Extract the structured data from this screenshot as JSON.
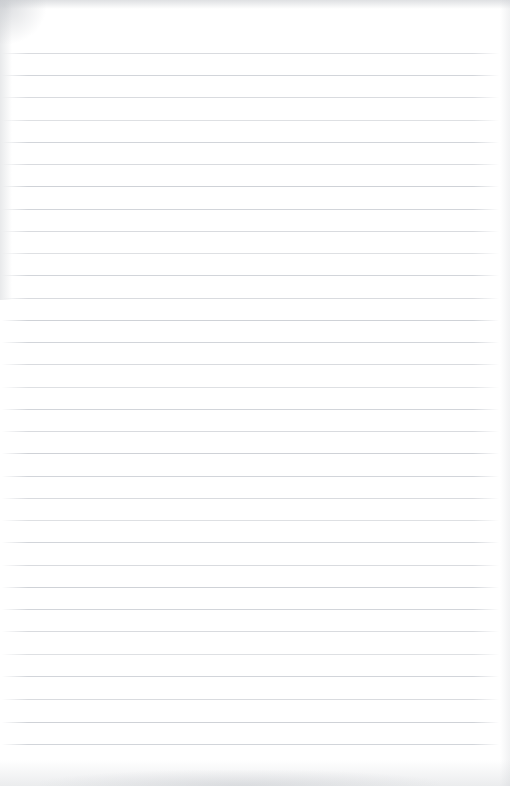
{
  "document": {
    "kind": "scanned-lined-paper",
    "title": "",
    "body_text": "",
    "is_blank": true,
    "page_width": 510,
    "page_height": 786,
    "background_color": "#ffffff"
  },
  "ruling": {
    "line_color": "#d5d8dc",
    "line_thickness": 1,
    "line_spacing": 22.2,
    "first_line_y": 53,
    "last_line_y": 744,
    "line_count": 32,
    "line_left_x": 2,
    "line_right_x": 499,
    "top_margin": 53,
    "bottom_margin": 42,
    "left_margin": 2,
    "right_margin": 11,
    "has_vertical_margin_rule": false,
    "lines": [
      {
        "y": 53,
        "variant": "v1"
      },
      {
        "y": 75,
        "variant": "v2"
      },
      {
        "y": 97,
        "variant": "v1"
      },
      {
        "y": 120,
        "variant": "v3"
      },
      {
        "y": 142,
        "variant": "v2"
      },
      {
        "y": 164,
        "variant": "v1"
      },
      {
        "y": 186,
        "variant": "v4"
      },
      {
        "y": 209,
        "variant": "v2"
      },
      {
        "y": 231,
        "variant": "v1"
      },
      {
        "y": 253,
        "variant": "v3"
      },
      {
        "y": 275,
        "variant": "v2"
      },
      {
        "y": 298,
        "variant": "v1"
      },
      {
        "y": 320,
        "variant": "v4"
      },
      {
        "y": 342,
        "variant": "v2"
      },
      {
        "y": 364,
        "variant": "v1"
      },
      {
        "y": 387,
        "variant": "v3"
      },
      {
        "y": 409,
        "variant": "v2"
      },
      {
        "y": 431,
        "variant": "v1"
      },
      {
        "y": 453,
        "variant": "v4"
      },
      {
        "y": 476,
        "variant": "v2"
      },
      {
        "y": 498,
        "variant": "v1"
      },
      {
        "y": 520,
        "variant": "v3"
      },
      {
        "y": 542,
        "variant": "v2"
      },
      {
        "y": 565,
        "variant": "v1"
      },
      {
        "y": 587,
        "variant": "v4"
      },
      {
        "y": 609,
        "variant": "v2"
      },
      {
        "y": 631,
        "variant": "v1"
      },
      {
        "y": 654,
        "variant": "v3"
      },
      {
        "y": 676,
        "variant": "v2"
      },
      {
        "y": 699,
        "variant": "v1"
      },
      {
        "y": 722,
        "variant": "v4"
      },
      {
        "y": 744,
        "variant": "v2"
      }
    ]
  },
  "artifacts": {
    "top_edge_shadow": true,
    "left_edge_shadow": true,
    "right_edge_shadow": true,
    "top_left_corner_smudge": true,
    "bottom_smudge_band": true,
    "shadow_color": "#c4c7cb"
  }
}
